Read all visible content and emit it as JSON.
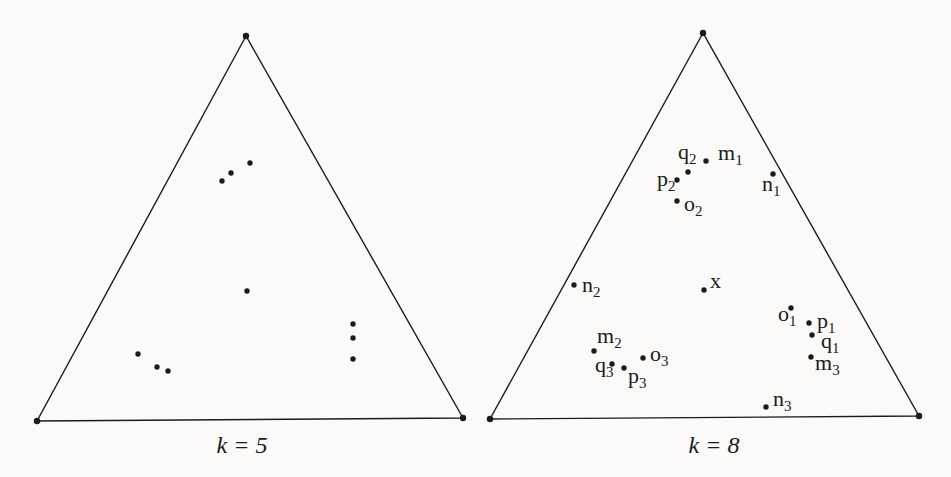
{
  "figure": {
    "type": "ternary-simplex-diagram-pair",
    "background_color": "#fbfaf8",
    "ink_color": "#1b1b1b",
    "line_width": 1.4,
    "vertex_dot_radius": 3.2,
    "point_dot_radius": 2.7,
    "panels": [
      {
        "id": "k5",
        "caption": {
          "text": "k = 5",
          "x": 242,
          "y": 453
        },
        "triangle": [
          [
            246,
            36
          ],
          [
            37,
            421
          ],
          [
            463,
            418
          ]
        ],
        "points": [
          [
            222,
            181
          ],
          [
            231,
            173
          ],
          [
            250,
            163
          ],
          [
            247,
            291
          ],
          [
            138,
            354
          ],
          [
            157,
            367
          ],
          [
            168,
            371
          ],
          [
            353,
            324
          ],
          [
            353,
            338
          ],
          [
            353,
            359
          ]
        ],
        "labeled_points": []
      },
      {
        "id": "k8",
        "caption": {
          "text": "k = 8",
          "x": 714,
          "y": 453
        },
        "triangle": [
          [
            703,
            33
          ],
          [
            490,
            419
          ],
          [
            919,
            416
          ]
        ],
        "points": [],
        "labeled_points": [
          {
            "base": "q",
            "sub": "2",
            "dot": [
              688,
              172
            ],
            "label": [
              678,
              159
            ]
          },
          {
            "base": "m",
            "sub": "1",
            "dot": [
              706,
              161
            ],
            "label": [
              718,
              160
            ]
          },
          {
            "base": "p",
            "sub": "2",
            "dot": [
              677,
              180
            ],
            "label": [
              657,
              186
            ]
          },
          {
            "base": "n",
            "sub": "1",
            "dot": [
              773,
              174
            ],
            "label": [
              762,
              191
            ]
          },
          {
            "base": "o",
            "sub": "2",
            "dot": [
              677,
              201
            ],
            "label": [
              684,
              211
            ]
          },
          {
            "base": "n",
            "sub": "2",
            "dot": [
              574,
              285
            ],
            "label": [
              582,
              292
            ]
          },
          {
            "base": "x",
            "sub": "",
            "dot": [
              704,
              290
            ],
            "label": [
              710,
              288
            ]
          },
          {
            "base": "o",
            "sub": "1",
            "dot": [
              791,
              308
            ],
            "label": [
              778,
              321
            ]
          },
          {
            "base": "p",
            "sub": "1",
            "dot": [
              809,
              323
            ],
            "label": [
              817,
              328
            ]
          },
          {
            "base": "q",
            "sub": "1",
            "dot": [
              812,
              335
            ],
            "label": [
              821,
              348
            ]
          },
          {
            "base": "m",
            "sub": "3",
            "dot": [
              811,
              357
            ],
            "label": [
              815,
              370
            ]
          },
          {
            "base": "m",
            "sub": "2",
            "dot": [
              594,
              351
            ],
            "label": [
              597,
              343
            ]
          },
          {
            "base": "q",
            "sub": "3",
            "dot": [
              612,
              364
            ],
            "label": [
              595,
              372
            ]
          },
          {
            "base": "p",
            "sub": "3",
            "dot": [
              624,
              368
            ],
            "label": [
              628,
              383
            ]
          },
          {
            "base": "o",
            "sub": "3",
            "dot": [
              643,
              358
            ],
            "label": [
              650,
              361
            ]
          },
          {
            "base": "n",
            "sub": "3",
            "dot": [
              766,
              407
            ],
            "label": [
              773,
              406
            ]
          }
        ]
      }
    ]
  }
}
